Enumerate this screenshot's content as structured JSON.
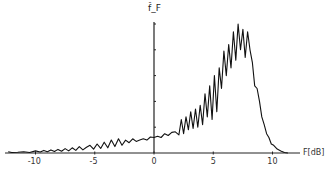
{
  "chart_data": {
    "type": "line",
    "title": "",
    "xlabel": "F[dB]",
    "ylabel": "f̂_F",
    "xlim": [
      -12.5,
      12.5
    ],
    "ylim": [
      0,
      5.2
    ],
    "xticks": [
      -10,
      -5,
      0,
      5,
      10
    ],
    "xtick_labels": [
      "-10",
      "-5",
      "0",
      "5",
      "10"
    ],
    "yticks": [
      1,
      2,
      3,
      4,
      5
    ],
    "ytick_labels": [],
    "grid": false,
    "legend": null,
    "series": [
      {
        "name": "f_F",
        "x": [
          -12.3,
          -12.0,
          -11.5,
          -11.0,
          -10.5,
          -10.0,
          -9.6,
          -9.3,
          -9.0,
          -8.7,
          -8.4,
          -8.1,
          -7.8,
          -7.5,
          -7.2,
          -6.9,
          -6.6,
          -6.3,
          -6.0,
          -5.7,
          -5.4,
          -5.1,
          -4.8,
          -4.5,
          -4.2,
          -3.9,
          -3.6,
          -3.3,
          -3.0,
          -2.7,
          -2.4,
          -2.1,
          -1.8,
          -1.5,
          -1.2,
          -0.9,
          -0.6,
          -0.3,
          0.0,
          0.3,
          0.6,
          0.9,
          1.2,
          1.5,
          1.8,
          2.1,
          2.3,
          2.5,
          2.7,
          2.9,
          3.1,
          3.3,
          3.5,
          3.7,
          3.9,
          4.1,
          4.3,
          4.5,
          4.7,
          4.9,
          5.1,
          5.3,
          5.5,
          5.7,
          5.9,
          6.1,
          6.3,
          6.5,
          6.7,
          6.9,
          7.1,
          7.3,
          7.5,
          7.7,
          7.9,
          8.1,
          8.3,
          8.5,
          8.7,
          8.9,
          9.1,
          9.3,
          9.5,
          9.7,
          9.9,
          10.1,
          10.4,
          10.7,
          11.0,
          11.3
        ],
        "y": [
          0.05,
          0.02,
          0.03,
          0.05,
          0.02,
          0.08,
          0.04,
          0.1,
          0.05,
          0.12,
          0.06,
          0.14,
          0.07,
          0.17,
          0.08,
          0.2,
          0.1,
          0.25,
          0.12,
          0.22,
          0.3,
          0.15,
          0.35,
          0.18,
          0.42,
          0.2,
          0.5,
          0.25,
          0.55,
          0.3,
          0.5,
          0.4,
          0.55,
          0.45,
          0.5,
          0.55,
          0.5,
          0.62,
          0.6,
          0.65,
          0.6,
          0.75,
          0.68,
          0.8,
          0.82,
          0.7,
          1.3,
          0.75,
          1.4,
          0.9,
          1.6,
          0.95,
          1.7,
          1.0,
          1.85,
          1.1,
          2.3,
          1.4,
          2.6,
          1.3,
          3.0,
          1.6,
          3.3,
          2.5,
          3.95,
          3.0,
          4.2,
          3.3,
          4.7,
          3.6,
          5.0,
          4.0,
          4.8,
          3.7,
          4.7,
          4.0,
          3.5,
          2.6,
          2.5,
          2.0,
          1.4,
          1.1,
          0.75,
          0.6,
          0.35,
          0.3,
          0.15,
          0.08,
          0.02,
          0.0
        ]
      }
    ]
  }
}
